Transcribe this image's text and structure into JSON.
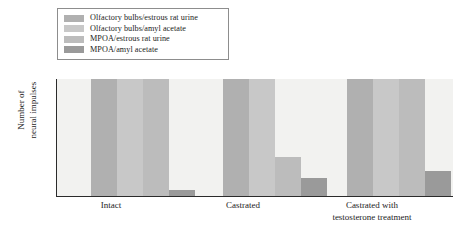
{
  "chart_data": {
    "type": "bar",
    "title": "",
    "xlabel": "",
    "ylabel_lines": [
      "Number of",
      "neural impulses"
    ],
    "ylabel": "Number of neural impulses",
    "categories": [
      "Intact",
      "Castrated",
      "Castrated with testosterone treatment"
    ],
    "category_lines": [
      [
        "Intact"
      ],
      [
        "Castrated"
      ],
      [
        "Castrated with",
        "testosterone treatment"
      ]
    ],
    "series": [
      {
        "name": "Olfactory bulbs/estrous rat urine",
        "color": "#b0b0b0",
        "values": [
          100,
          100,
          100
        ]
      },
      {
        "name": "Olfactory bulbs/amyl acetate",
        "color": "#c8c8c8",
        "values": [
          100,
          100,
          100
        ]
      },
      {
        "name": "MPOA/estrous rat urine",
        "color": "#bcbcbc",
        "values": [
          100,
          34,
          100
        ]
      },
      {
        "name": "MPOA/amyl acetate",
        "color": "#9a9a9a",
        "values": [
          6,
          16,
          22
        ]
      }
    ],
    "ylim": [
      0,
      100
    ],
    "y_ticks": [],
    "grid": false,
    "legend_position": "above-plot-left",
    "plot_background": "#f2f2f0",
    "axis_color": "#2b2b2b"
  },
  "legend": {
    "items": [
      {
        "label": "Olfactory bulbs/estrous rat urine",
        "color": "#b0b0b0"
      },
      {
        "label": "Olfactory bulbs/amyl acetate",
        "color": "#c8c8c8"
      },
      {
        "label": "MPOA/estrous rat urine",
        "color": "#bcbcbc"
      },
      {
        "label": "MPOA/amyl acetate",
        "color": "#9a9a9a"
      }
    ]
  }
}
